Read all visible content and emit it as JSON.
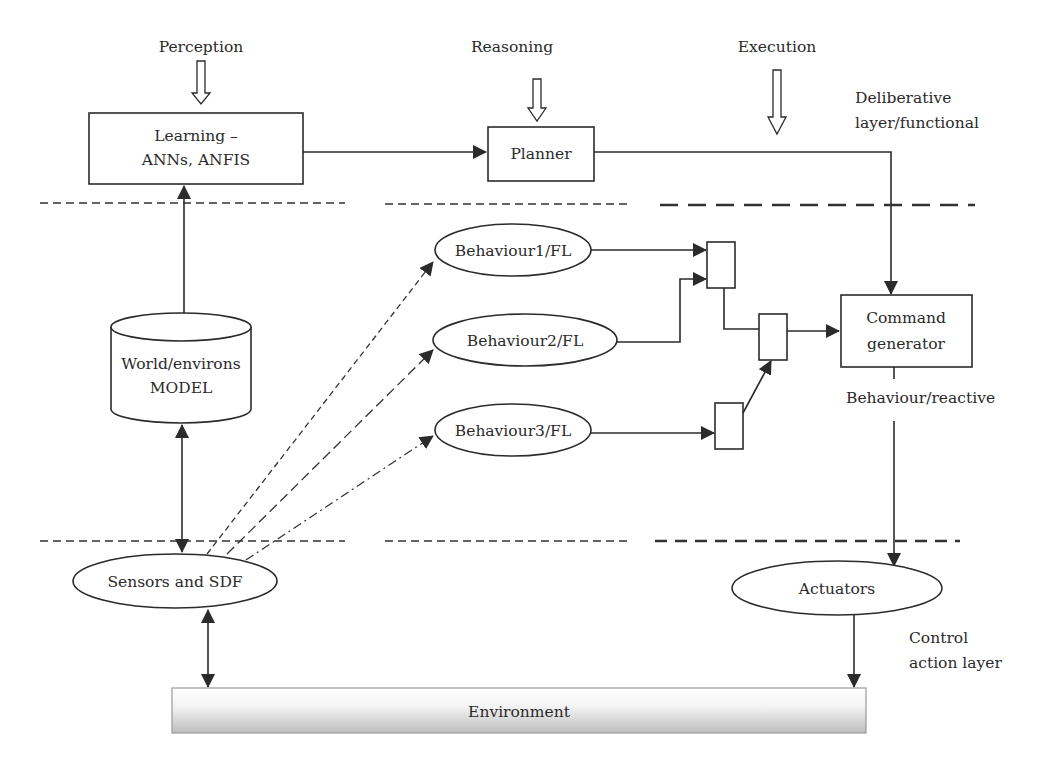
{
  "diagram": {
    "top_labels": {
      "perception": "Perception",
      "reasoning": "Reasoning",
      "execution": "Execution"
    },
    "layer_labels": {
      "deliberative_line1": "Deliberative",
      "deliberative_line2": "layer/functional",
      "behaviour": "Behaviour/reactive",
      "control_line1": "Control",
      "control_line2": "action layer"
    },
    "nodes": {
      "learning_line1": "Learning –",
      "learning_line2": "ANNs, ANFIS",
      "planner": "Planner",
      "world_model_line1": "World/environs",
      "world_model_line2": "MODEL",
      "behaviour1": "Behaviour1/FL",
      "behaviour2": "Behaviour2/FL",
      "behaviour3": "Behaviour3/FL",
      "command_line1": "Command",
      "command_line2": "generator",
      "sensors": "Sensors and SDF",
      "actuators": "Actuators",
      "environment": "Environment"
    },
    "edges": [
      {
        "from": "Learning",
        "to": "Planner",
        "style": "solid"
      },
      {
        "from": "Planner",
        "to": "Command generator",
        "style": "solid"
      },
      {
        "from": "World/environs MODEL",
        "to": "Learning",
        "style": "solid"
      },
      {
        "from": "World/environs MODEL",
        "to": "Sensors and SDF",
        "style": "solid-bidirectional"
      },
      {
        "from": "Sensors and SDF",
        "to": "Behaviour1/FL",
        "style": "dashed-short"
      },
      {
        "from": "Sensors and SDF",
        "to": "Behaviour2/FL",
        "style": "dashed-long"
      },
      {
        "from": "Sensors and SDF",
        "to": "Behaviour3/FL",
        "style": "dash-dot"
      },
      {
        "from": "Behaviour1/FL",
        "to": "Arbiter 1",
        "style": "solid"
      },
      {
        "from": "Behaviour2/FL",
        "to": "Arbiter 1",
        "style": "solid"
      },
      {
        "from": "Behaviour3/FL",
        "to": "Arbiter 3",
        "style": "solid"
      },
      {
        "from": "Arbiter 1",
        "to": "Arbiter 2",
        "style": "solid"
      },
      {
        "from": "Arbiter 3",
        "to": "Arbiter 2",
        "style": "solid"
      },
      {
        "from": "Arbiter 2",
        "to": "Command generator",
        "style": "solid"
      },
      {
        "from": "Command generator",
        "to": "Actuators",
        "style": "solid"
      },
      {
        "from": "Actuators",
        "to": "Environment",
        "style": "solid"
      },
      {
        "from": "Environment",
        "to": "Sensors and SDF",
        "style": "solid-bidirectional"
      }
    ]
  }
}
